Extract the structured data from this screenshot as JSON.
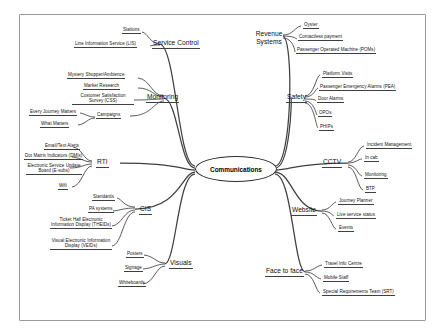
{
  "diagram": {
    "type": "mind-map",
    "center": {
      "label": "Communications"
    },
    "branches": [
      {
        "id": "service-control",
        "label": "Service Control",
        "children": [
          {
            "label": "Stations"
          },
          {
            "label": "Line Information Service (LIS)"
          }
        ]
      },
      {
        "id": "monitoring",
        "label": "Monitoring",
        "children": [
          {
            "label": "Mystery Shopper/Ambience"
          },
          {
            "label": "Market Research"
          },
          {
            "label": "Customer Satisfaction Survey (CSS)"
          },
          {
            "label": "Campaigns",
            "children": [
              {
                "label": "Every Journey Matters"
              },
              {
                "label": "What Matters"
              }
            ]
          }
        ]
      },
      {
        "id": "rti",
        "label": "RTI",
        "children": [
          {
            "label": "Email/Text Alerts"
          },
          {
            "label": "Dot Matrix Indicators (DMIs)"
          },
          {
            "label": "Electronic Service Update Board (E-subs)"
          },
          {
            "label": "Wifi"
          }
        ]
      },
      {
        "id": "cis",
        "label": "CIS",
        "children": [
          {
            "label": "Standards"
          },
          {
            "label": "PA systems"
          },
          {
            "label": "Ticket Hall Electronic Information Display (THEIDs)"
          },
          {
            "label": "Visual Electronic Information Display (VEIDs)"
          }
        ]
      },
      {
        "id": "visuals",
        "label": "Visuals",
        "children": [
          {
            "label": "Posters"
          },
          {
            "label": "Signage"
          },
          {
            "label": "Whiteboards"
          }
        ]
      },
      {
        "id": "revenue-systems",
        "label": "Revenue Systems",
        "children": [
          {
            "label": "Oyster"
          },
          {
            "label": "Contactless payment"
          },
          {
            "label": "Passenger Operated Machine (POMs)"
          }
        ]
      },
      {
        "id": "safety",
        "label": "Safety",
        "children": [
          {
            "label": "Platform Visits"
          },
          {
            "label": "Passenger Emergency Alarms (PEA)"
          },
          {
            "label": "Door Alarms"
          },
          {
            "label": "OPOs"
          },
          {
            "label": "PHIPs"
          }
        ]
      },
      {
        "id": "cctv",
        "label": "CCTV",
        "children": [
          {
            "label": "Incident Management"
          },
          {
            "label": "In cab"
          },
          {
            "label": "Monitoring"
          },
          {
            "label": "BTP"
          }
        ]
      },
      {
        "id": "website",
        "label": "Website",
        "children": [
          {
            "label": "Journey Planner"
          },
          {
            "label": "Live service status"
          },
          {
            "label": "Events"
          }
        ]
      },
      {
        "id": "face-to-face",
        "label": "Face to face",
        "children": [
          {
            "label": "Travel Info Centre"
          },
          {
            "label": "Mobile Staff"
          },
          {
            "label": "Special Requirements Team (SRT)"
          }
        ]
      }
    ]
  }
}
